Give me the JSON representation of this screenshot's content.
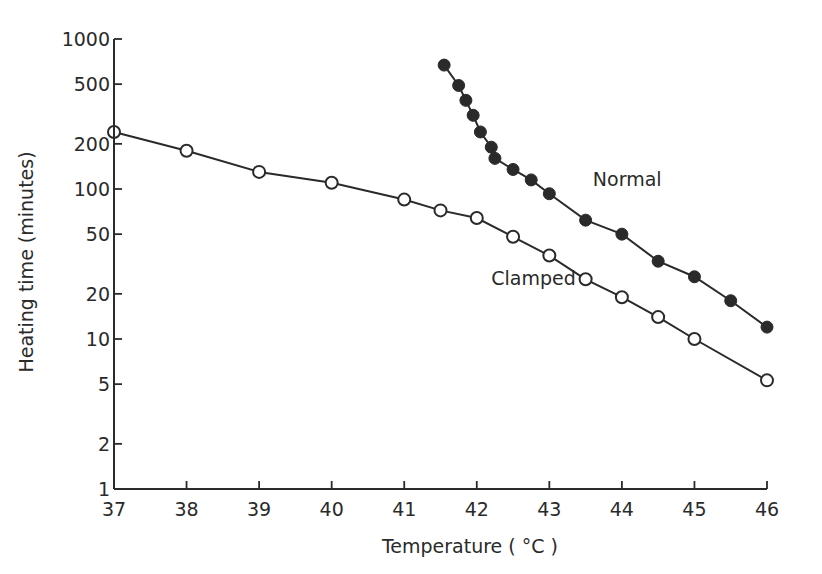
{
  "chart_data": {
    "type": "line",
    "title": "",
    "xlabel": "Temperature ( °C )",
    "ylabel": "Heating time (minutes)",
    "xlim": [
      37,
      46
    ],
    "ylim": [
      1,
      1000
    ],
    "yscale": "log",
    "grid": false,
    "legend_position": "inline labels",
    "x_ticks": [
      37,
      38,
      39,
      40,
      41,
      42,
      43,
      44,
      45,
      46
    ],
    "x_tick_labels": [
      "37",
      "38",
      "39",
      "40",
      "41",
      "42",
      "43",
      "44",
      "45",
      "46"
    ],
    "y_ticks": [
      1,
      2,
      5,
      10,
      20,
      50,
      100,
      200,
      500,
      1000
    ],
    "y_tick_labels": [
      "1",
      "2",
      "5",
      "10",
      "20",
      "50",
      "100",
      "200",
      "500",
      "1000"
    ],
    "series": [
      {
        "name": "Normal",
        "marker": "filled-circle",
        "label_pos": {
          "x": 43.6,
          "y": 105
        },
        "x": [
          41.55,
          41.75,
          41.85,
          41.95,
          42.05,
          42.2,
          42.25,
          42.5,
          42.75,
          43.0,
          43.5,
          44.0,
          44.5,
          45.0,
          45.5,
          46.0
        ],
        "values": [
          670,
          490,
          390,
          310,
          240,
          190,
          160,
          135,
          115,
          93,
          62,
          50,
          33,
          26,
          18,
          12
        ]
      },
      {
        "name": "Clamped",
        "marker": "open-circle",
        "label_pos": {
          "x": 42.2,
          "y": 23
        },
        "x": [
          37.0,
          38.0,
          39.0,
          40.0,
          41.0,
          41.5,
          42.0,
          42.5,
          43.0,
          43.5,
          44.0,
          44.5,
          45.0,
          46.0
        ],
        "values": [
          240,
          180,
          130,
          110,
          85,
          72,
          64,
          48,
          36,
          25,
          19,
          14,
          10,
          5.3
        ]
      }
    ]
  }
}
